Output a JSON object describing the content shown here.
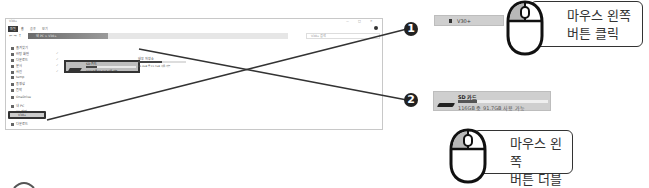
{
  "explorer": {
    "title": "V30+",
    "ribbon_tabs": [
      "파일",
      "홈",
      "공유",
      "보기"
    ],
    "address_path": "내 PC  >  V30+",
    "search_placeholder": "V30+ 검색",
    "sidebar": {
      "items": [
        {
          "label": "즐겨찾기",
          "pinned": false
        },
        {
          "label": "바탕 화면",
          "pinned": true
        },
        {
          "label": "다운로드",
          "pinned": true
        },
        {
          "label": "문서",
          "pinned": true
        },
        {
          "label": "사진",
          "pinned": true
        },
        {
          "label": "temp",
          "pinned": false
        },
        {
          "label": "동영상",
          "pinned": false
        },
        {
          "label": "음악",
          "pinned": false
        },
        {
          "label": "OneDrive",
          "pinned": false
        },
        {
          "label": "내 PC",
          "pinned": false
        },
        {
          "label": "3D 개체",
          "pinned": false
        },
        {
          "label": "V30+",
          "pinned": false,
          "selected": true
        },
        {
          "label": "다운로드",
          "pinned": false
        }
      ]
    },
    "drives": [
      {
        "name": "SD 카드",
        "info": "116GB 중 91.7GB 사용 가능",
        "used_fraction": 0.21,
        "highlighted": true
      },
      {
        "name": "내부 저장소",
        "info": "44.3GB 중 21.7GB 사용 가능",
        "used_fraction": 0.51,
        "highlighted": false
      }
    ]
  },
  "steps": [
    {
      "number": "1",
      "snippet_label": "V30+",
      "callout": [
        "마우스 왼쪽",
        "버튼 클릭"
      ]
    },
    {
      "number": "2",
      "snippet_name": "SD 카드",
      "snippet_info": "116GB 중 91.7GB 사용 가능",
      "snippet_used_fraction": 0.21,
      "callout": [
        "마우스 왼쪽",
        "버튼 더블클릭"
      ]
    }
  ],
  "colors": {
    "line": "#333333",
    "badge": "#222222",
    "mouse_left_button": "#b8b8b8",
    "snippet_bg": "#cfcfcf"
  }
}
